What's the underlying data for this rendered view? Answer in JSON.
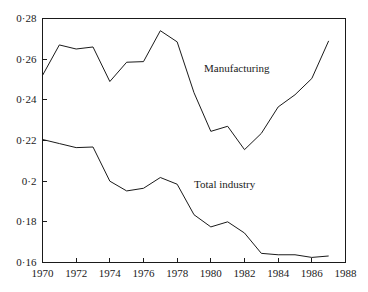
{
  "chart_data": {
    "type": "line",
    "title": "",
    "subtitle": "",
    "xlabel": "",
    "ylabel": "",
    "xlim": [
      1970,
      1988
    ],
    "ylim": [
      0.16,
      0.28
    ],
    "grid": false,
    "legend_position": "inline-annotation",
    "x_tick_labels": [
      "1970",
      "1972",
      "1974",
      "1976",
      "1978",
      "1980",
      "1982",
      "1984",
      "1986",
      "1988"
    ],
    "x_ticks": [
      1970,
      1972,
      1974,
      1976,
      1978,
      1980,
      1982,
      1984,
      1986,
      1988
    ],
    "y_tick_labels": [
      "0·28",
      "0·26",
      "0·24",
      "0·22",
      "0·2",
      "0·18",
      "0·16"
    ],
    "y_ticks": [
      0.28,
      0.26,
      0.24,
      0.22,
      0.2,
      0.18,
      0.16
    ],
    "x": [
      1970,
      1971,
      1972,
      1973,
      1974,
      1975,
      1976,
      1977,
      1978,
      1979,
      1980,
      1981,
      1982,
      1983,
      1984,
      1985,
      1986,
      1987
    ],
    "series": [
      {
        "name": "Manufacturing",
        "color": "#1a1a1a",
        "values": [
          0.252,
          0.267,
          0.265,
          0.266,
          0.249,
          0.2585,
          0.2588,
          0.274,
          0.2685,
          0.2435,
          0.2245,
          0.227,
          0.2155,
          0.2235,
          0.2365,
          0.2425,
          0.2505,
          0.269
        ]
      },
      {
        "name": "Total industry",
        "color": "#1a1a1a",
        "values": [
          0.2205,
          0.2185,
          0.2165,
          0.2168,
          0.2,
          0.1952,
          0.1965,
          0.2018,
          0.1985,
          0.1835,
          0.1775,
          0.18,
          0.1745,
          0.1645,
          0.1638,
          0.1638,
          0.1625,
          0.1632
        ]
      }
    ],
    "annotations": [
      {
        "text": "Manufacturing",
        "x": 1979.6,
        "y": 0.2555
      },
      {
        "text": "Total industry",
        "x": 1979.0,
        "y": 0.1985
      }
    ]
  },
  "axes": {
    "line_color": "#1a1a1a",
    "background": "#ffffff"
  }
}
